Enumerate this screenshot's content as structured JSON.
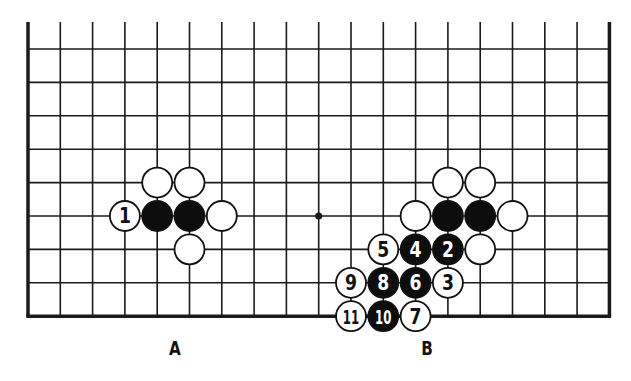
{
  "board": {
    "columns": 19,
    "rows": 9,
    "origin_x": 28,
    "origin_y": 49,
    "spacing_x": 32.3,
    "spacing_y": 33.4,
    "top_edge_open": true,
    "open_edge_extension": 27,
    "line_color": "#1a1a1a",
    "border_width": 3.5,
    "line_width": 1.6,
    "star_points": [
      {
        "col": 9,
        "row": 5
      }
    ],
    "stone_radius": 15
  },
  "stones": [
    {
      "col": 4,
      "row": 4,
      "color": "white",
      "label": ""
    },
    {
      "col": 5,
      "row": 4,
      "color": "white",
      "label": ""
    },
    {
      "col": 3,
      "row": 5,
      "color": "white",
      "label": "1"
    },
    {
      "col": 4,
      "row": 5,
      "color": "black",
      "label": ""
    },
    {
      "col": 5,
      "row": 5,
      "color": "black",
      "label": ""
    },
    {
      "col": 6,
      "row": 5,
      "color": "white",
      "label": ""
    },
    {
      "col": 5,
      "row": 6,
      "color": "white",
      "label": ""
    },
    {
      "col": 13,
      "row": 4,
      "color": "white",
      "label": ""
    },
    {
      "col": 14,
      "row": 4,
      "color": "white",
      "label": ""
    },
    {
      "col": 12,
      "row": 5,
      "color": "white",
      "label": ""
    },
    {
      "col": 13,
      "row": 5,
      "color": "black",
      "label": ""
    },
    {
      "col": 14,
      "row": 5,
      "color": "black",
      "label": ""
    },
    {
      "col": 15,
      "row": 5,
      "color": "white",
      "label": ""
    },
    {
      "col": 11,
      "row": 6,
      "color": "white",
      "label": "5"
    },
    {
      "col": 12,
      "row": 6,
      "color": "black",
      "label": "4"
    },
    {
      "col": 13,
      "row": 6,
      "color": "black",
      "label": "2"
    },
    {
      "col": 14,
      "row": 6,
      "color": "white",
      "label": ""
    },
    {
      "col": 10,
      "row": 7,
      "color": "white",
      "label": "9"
    },
    {
      "col": 11,
      "row": 7,
      "color": "black",
      "label": "8"
    },
    {
      "col": 12,
      "row": 7,
      "color": "black",
      "label": "6"
    },
    {
      "col": 13,
      "row": 7,
      "color": "white",
      "label": "3"
    },
    {
      "col": 10,
      "row": 8,
      "color": "white",
      "label": "11"
    },
    {
      "col": 11,
      "row": 8,
      "color": "black",
      "label": "10"
    },
    {
      "col": 12,
      "row": 8,
      "color": "white",
      "label": "7"
    }
  ],
  "labels": [
    {
      "text": "A",
      "x": 175,
      "y": 348
    },
    {
      "text": "B",
      "x": 427,
      "y": 348
    }
  ]
}
